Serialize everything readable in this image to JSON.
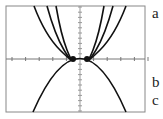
{
  "chart_data": {
    "type": "line",
    "title": "",
    "xlabel": "",
    "ylabel": "",
    "grid": false,
    "axes": {
      "x_tick_count_each_side": 5,
      "y_tick_count_each_side": 10
    },
    "series": [
      {
        "name": "upward-parabola-1",
        "direction": "up",
        "shape": "x^2 shifted pair"
      },
      {
        "name": "upward-parabola-2",
        "direction": "up",
        "shape": "x^2 shifted pair"
      },
      {
        "name": "upward-parabola-3",
        "direction": "up",
        "shape": "x^2 shifted pair"
      },
      {
        "name": "downward-parabola",
        "direction": "down",
        "shape": "-x^2"
      }
    ],
    "points": [
      {
        "x": -1,
        "y": 0
      },
      {
        "x": 1,
        "y": 0
      }
    ],
    "annotations": [
      "a",
      "b",
      "c"
    ]
  },
  "labels": {
    "a": "a",
    "b": "b",
    "c": "c"
  },
  "colors": {
    "curve": "#111111",
    "frame": "#888888",
    "axis": "#777777",
    "background": "#ffffff"
  }
}
